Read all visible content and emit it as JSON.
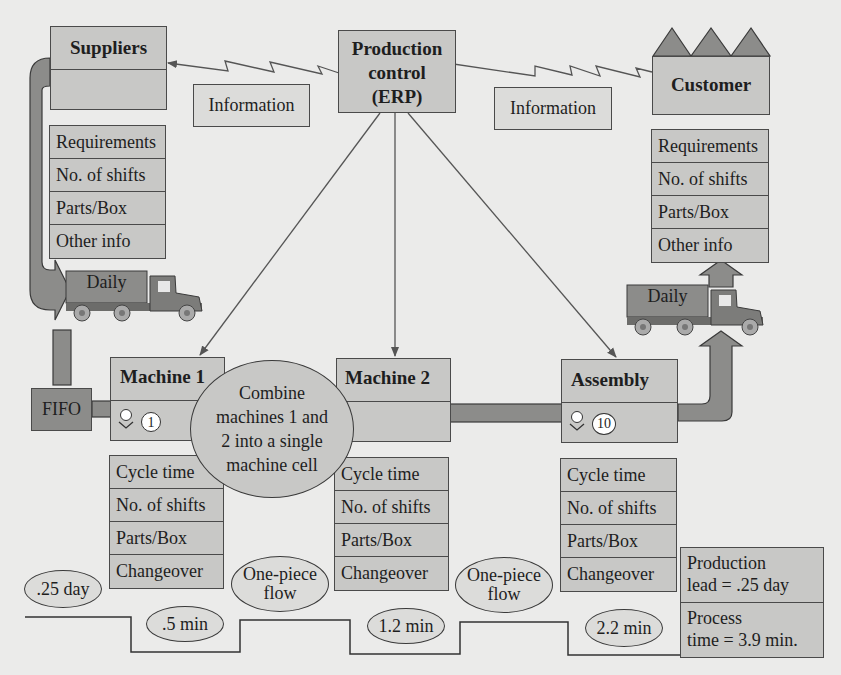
{
  "diagram": {
    "type": "value-stream-map",
    "colors": {
      "background": "#ebebea",
      "box_fill": "#c8c8c6",
      "dark_fill": "#8c8c8a",
      "line": "#4a4a4a"
    }
  },
  "suppliers": {
    "title": "Suppliers",
    "info": [
      "Requirements",
      "No. of shifts",
      "Parts/Box",
      "Other info"
    ]
  },
  "production_control": {
    "line1": "Production",
    "line2": "control",
    "line3": "(ERP)"
  },
  "customer": {
    "title": "Customer",
    "info": [
      "Requirements",
      "No. of shifts",
      "Parts/Box",
      "Other info"
    ]
  },
  "information_flows": {
    "left": "Information",
    "right": "Information"
  },
  "trucks": {
    "inbound": "Daily",
    "outbound": "Daily"
  },
  "fifo": {
    "label": "FIFO"
  },
  "processes": [
    {
      "name": "Machine 1",
      "operators": "1",
      "data": [
        "Cycle time",
        "No. of shifts",
        "Parts/Box",
        "Changeover"
      ]
    },
    {
      "name": "Machine 2",
      "operators": "",
      "data": [
        "Cycle time",
        "No. of shifts",
        "Parts/Box",
        "Changeover"
      ]
    },
    {
      "name": "Assembly",
      "operators": "10",
      "data": [
        "Cycle time",
        "No. of shifts",
        "Parts/Box",
        "Changeover"
      ]
    }
  ],
  "kaizen": {
    "line1": "Combine",
    "line2": "machines 1 and",
    "line3": "2 into a single",
    "line4": "machine cell"
  },
  "flows": {
    "flow1_l1": "One-piece",
    "flow1_l2": "flow",
    "flow2_l1": "One-piece",
    "flow2_l2": "flow"
  },
  "timeline": {
    "wait": ".25 day",
    "process_times": [
      ".5 min",
      "1.2 min",
      "2.2 min"
    ]
  },
  "summary": {
    "lead_l1": "Production",
    "lead_l2": "lead = .25 day",
    "process_l1": "Process",
    "process_l2": "time = 3.9 min."
  }
}
